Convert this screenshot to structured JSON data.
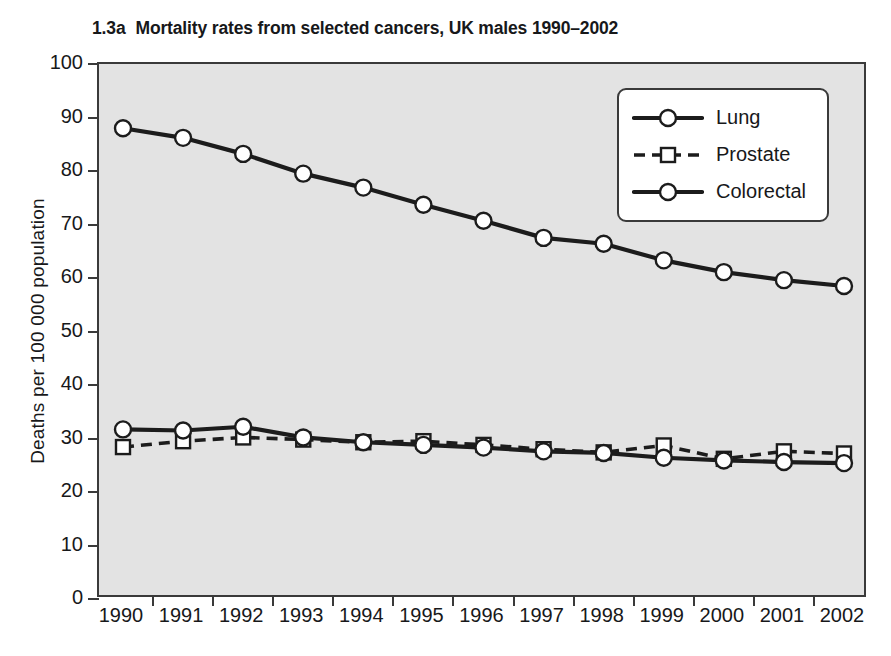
{
  "title": {
    "index": "1.3a",
    "text": "Mortality rates from selected cancers, UK males 1990–2002",
    "full": "1.3a  Mortality rates from selected cancers, UK males 1990–2002"
  },
  "colors": {
    "plot_background": "#e3e3e3",
    "axis": "#3a3a3a",
    "line": "#1c1c1c",
    "marker_fill": "#ffffff",
    "legend_background": "#ffffff",
    "page_background": "#ffffff"
  },
  "legend": {
    "position": "top-right-inside",
    "entries": [
      {
        "label": "Lung",
        "marker": "circle",
        "dash": "solid"
      },
      {
        "label": "Prostate",
        "marker": "square",
        "dash": "dashed"
      },
      {
        "label": "Colorectal",
        "marker": "circle",
        "dash": "solid"
      }
    ]
  },
  "chart_data": {
    "type": "line",
    "xlabel": "",
    "ylabel": "Deaths per 100 000 population",
    "categories": [
      1990,
      1991,
      1992,
      1993,
      1994,
      1995,
      1996,
      1997,
      1998,
      1999,
      2000,
      2001,
      2002
    ],
    "x_tick_labels": [
      "1990",
      "1991",
      "1992",
      "1993",
      "1994",
      "1995",
      "1996",
      "1997",
      "1998",
      "1999",
      "2000",
      "2001",
      "2002"
    ],
    "y_tick_labels": [
      "0",
      "10",
      "20",
      "30",
      "40",
      "50",
      "60",
      "70",
      "80",
      "90",
      "100"
    ],
    "y_ticks": [
      0,
      10,
      20,
      30,
      40,
      50,
      60,
      70,
      80,
      90,
      100
    ],
    "ylim": [
      0,
      100
    ],
    "grid": false,
    "legend_position": "upper right",
    "series": [
      {
        "name": "Lung",
        "marker": "circle",
        "dash": "solid",
        "values": [
          88.0,
          86.2,
          83.2,
          79.5,
          76.9,
          73.7,
          70.7,
          67.5,
          66.4,
          63.3,
          61.1,
          59.6,
          58.5
        ]
      },
      {
        "name": "Prostate",
        "marker": "square",
        "dash": "dashed",
        "values": [
          28.4,
          29.5,
          30.2,
          29.8,
          29.3,
          29.5,
          28.8,
          28.0,
          27.4,
          28.7,
          26.2,
          27.6,
          27.2
        ]
      },
      {
        "name": "Colorectal",
        "marker": "circle",
        "dash": "solid",
        "values": [
          31.7,
          31.5,
          32.2,
          30.2,
          29.3,
          28.8,
          28.3,
          27.6,
          27.3,
          26.4,
          25.9,
          25.6,
          25.4
        ]
      }
    ]
  }
}
